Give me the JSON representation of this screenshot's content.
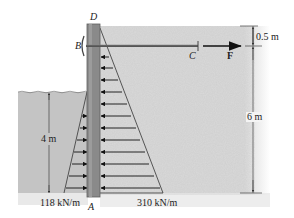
{
  "figure": {
    "type": "sheet-pile wall with tie rod and lateral pressure distributions",
    "points": {
      "top": "D",
      "anchor": "B",
      "rod_end": "C",
      "base": "A"
    },
    "force_label": "F",
    "dimensions": {
      "top_offset": "0.5 m",
      "soil_height": "6 m",
      "water_depth": "4 m"
    },
    "loads": {
      "left_max": "118 kN/m",
      "right_max": "310 kN/m"
    },
    "colors": {
      "soil": "#d9d9d9",
      "water": "#c4c4c4",
      "wall": "#8a8a8a",
      "wall_edge": "#5f5f5f",
      "rod": "#555555",
      "arrow": "#111111",
      "dim_line": "#444444"
    }
  }
}
